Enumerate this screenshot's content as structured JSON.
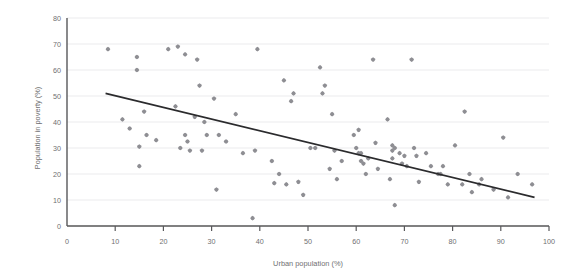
{
  "chart_data": {
    "type": "scatter",
    "title": "",
    "subtitle": "",
    "xlabel": "Urban population (%)",
    "ylabel": "Population in poverty (%)",
    "xlim": [
      0,
      100
    ],
    "ylim": [
      0,
      80
    ],
    "xticks": [
      0,
      10,
      20,
      30,
      40,
      50,
      60,
      70,
      80,
      90,
      100
    ],
    "yticks": [
      0,
      10,
      20,
      30,
      40,
      50,
      60,
      70,
      80
    ],
    "xtick_labels": [
      "0",
      "10",
      "20",
      "30",
      "40",
      "50",
      "60",
      "70",
      "80",
      "90",
      "100"
    ],
    "ytick_labels": [
      "0",
      "10",
      "20",
      "30",
      "40",
      "50",
      "60",
      "70",
      "80"
    ],
    "grid": true,
    "grid_axis": "y",
    "legend": false,
    "legend_position": "none",
    "marker_color": "#8e8e93",
    "marker_shape": "diamond-plus",
    "trendline": {
      "type": "linear",
      "color": "#2b2b2d",
      "x_start": 8,
      "y_start": 51,
      "x_end": 97,
      "y_end": 11,
      "slope": -0.449,
      "intercept": 54.6
    },
    "points": [
      {
        "x": 8.5,
        "y": 68
      },
      {
        "x": 11.5,
        "y": 41
      },
      {
        "x": 13.0,
        "y": 37.5
      },
      {
        "x": 14.5,
        "y": 65
      },
      {
        "x": 14.5,
        "y": 60
      },
      {
        "x": 15.0,
        "y": 30.5
      },
      {
        "x": 15.0,
        "y": 23
      },
      {
        "x": 16.0,
        "y": 44
      },
      {
        "x": 16.5,
        "y": 35
      },
      {
        "x": 18.5,
        "y": 33
      },
      {
        "x": 21.0,
        "y": 68
      },
      {
        "x": 22.5,
        "y": 46
      },
      {
        "x": 23.0,
        "y": 69
      },
      {
        "x": 23.5,
        "y": 30
      },
      {
        "x": 24.5,
        "y": 66
      },
      {
        "x": 24.5,
        "y": 35
      },
      {
        "x": 25.0,
        "y": 32.5
      },
      {
        "x": 25.5,
        "y": 29
      },
      {
        "x": 26.5,
        "y": 42
      },
      {
        "x": 27.0,
        "y": 64
      },
      {
        "x": 27.5,
        "y": 54
      },
      {
        "x": 28.0,
        "y": 29
      },
      {
        "x": 28.5,
        "y": 40
      },
      {
        "x": 29.0,
        "y": 35
      },
      {
        "x": 30.5,
        "y": 49
      },
      {
        "x": 31.0,
        "y": 14
      },
      {
        "x": 31.5,
        "y": 35
      },
      {
        "x": 33.0,
        "y": 32.5
      },
      {
        "x": 35.0,
        "y": 43
      },
      {
        "x": 36.5,
        "y": 28
      },
      {
        "x": 38.5,
        "y": 3
      },
      {
        "x": 39.0,
        "y": 29
      },
      {
        "x": 39.5,
        "y": 68
      },
      {
        "x": 42.5,
        "y": 25
      },
      {
        "x": 43.0,
        "y": 16.5
      },
      {
        "x": 44.0,
        "y": 20
      },
      {
        "x": 45.0,
        "y": 56
      },
      {
        "x": 45.5,
        "y": 16
      },
      {
        "x": 46.5,
        "y": 48
      },
      {
        "x": 47.0,
        "y": 51
      },
      {
        "x": 48.0,
        "y": 17
      },
      {
        "x": 49.0,
        "y": 12
      },
      {
        "x": 50.5,
        "y": 30
      },
      {
        "x": 51.5,
        "y": 30
      },
      {
        "x": 52.5,
        "y": 61
      },
      {
        "x": 53.0,
        "y": 51
      },
      {
        "x": 53.5,
        "y": 54
      },
      {
        "x": 54.5,
        "y": 22
      },
      {
        "x": 55.0,
        "y": 43
      },
      {
        "x": 55.5,
        "y": 29
      },
      {
        "x": 56.0,
        "y": 18
      },
      {
        "x": 57.0,
        "y": 25
      },
      {
        "x": 59.5,
        "y": 35
      },
      {
        "x": 60.0,
        "y": 30
      },
      {
        "x": 60.5,
        "y": 37
      },
      {
        "x": 60.5,
        "y": 28
      },
      {
        "x": 61.0,
        "y": 28
      },
      {
        "x": 61.0,
        "y": 25
      },
      {
        "x": 61.5,
        "y": 24
      },
      {
        "x": 62.0,
        "y": 20
      },
      {
        "x": 62.5,
        "y": 26
      },
      {
        "x": 63.5,
        "y": 64
      },
      {
        "x": 64.0,
        "y": 32
      },
      {
        "x": 64.5,
        "y": 22
      },
      {
        "x": 66.5,
        "y": 41
      },
      {
        "x": 67.0,
        "y": 18
      },
      {
        "x": 67.5,
        "y": 31
      },
      {
        "x": 67.5,
        "y": 29
      },
      {
        "x": 67.5,
        "y": 26
      },
      {
        "x": 68.0,
        "y": 30
      },
      {
        "x": 68.0,
        "y": 8
      },
      {
        "x": 69.0,
        "y": 28
      },
      {
        "x": 69.5,
        "y": 24
      },
      {
        "x": 70.0,
        "y": 27
      },
      {
        "x": 70.5,
        "y": 23
      },
      {
        "x": 71.5,
        "y": 64
      },
      {
        "x": 72.0,
        "y": 30
      },
      {
        "x": 72.5,
        "y": 27
      },
      {
        "x": 73.0,
        "y": 17
      },
      {
        "x": 74.5,
        "y": 28
      },
      {
        "x": 75.5,
        "y": 23
      },
      {
        "x": 77.0,
        "y": 20
      },
      {
        "x": 77.5,
        "y": 20
      },
      {
        "x": 78.0,
        "y": 23
      },
      {
        "x": 79.0,
        "y": 16
      },
      {
        "x": 80.5,
        "y": 31
      },
      {
        "x": 82.0,
        "y": 16
      },
      {
        "x": 82.5,
        "y": 44
      },
      {
        "x": 83.5,
        "y": 20
      },
      {
        "x": 84.0,
        "y": 13
      },
      {
        "x": 85.5,
        "y": 16
      },
      {
        "x": 86.0,
        "y": 18
      },
      {
        "x": 88.5,
        "y": 14
      },
      {
        "x": 90.5,
        "y": 34
      },
      {
        "x": 91.5,
        "y": 11
      },
      {
        "x": 93.5,
        "y": 20
      },
      {
        "x": 96.5,
        "y": 16
      }
    ]
  }
}
